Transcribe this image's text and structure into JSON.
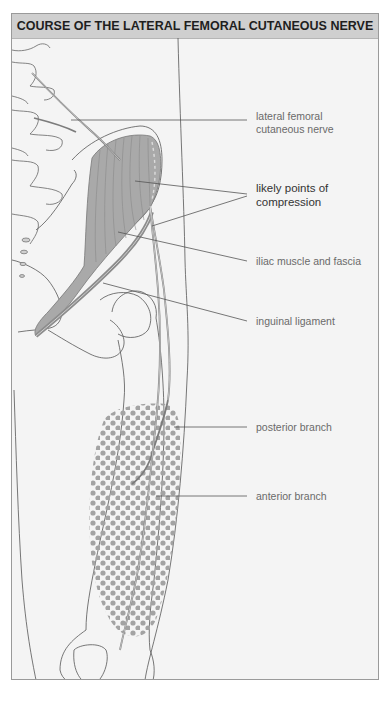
{
  "figure": {
    "title": "COURSE OF THE LATERAL FEMORAL CUTANEOUS NERVE",
    "colors": {
      "header_bg": "#cfcfcf",
      "panel_bg": "#f4f4f4",
      "muscle_fill": "#a9a9a9",
      "dot_color": "#a3a3a3",
      "line_color": "#555555"
    },
    "labels": [
      {
        "id": "nerve",
        "line1": "lateral femoral",
        "line2": "cutaneous nerve"
      },
      {
        "id": "compression",
        "line1": "likely points of",
        "line2": "compression"
      },
      {
        "id": "iliac",
        "line1": "iliac muscle and fascia",
        "line2": ""
      },
      {
        "id": "inguinal",
        "line1": "inguinal ligament",
        "line2": ""
      },
      {
        "id": "posterior",
        "line1": "posterior branch",
        "line2": ""
      },
      {
        "id": "anterior",
        "line1": "anterior branch",
        "line2": ""
      }
    ]
  }
}
